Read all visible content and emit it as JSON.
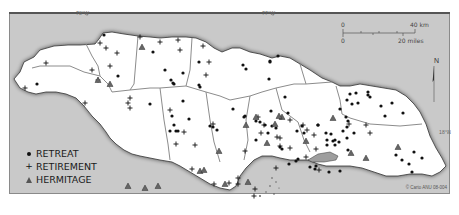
{
  "map": {
    "region": "Jamaica",
    "background_color": "#c9c9c9",
    "land_color": "#ffffff",
    "boundary_color": "#8c8c8c",
    "coordinates": {
      "lon_left": "78°W",
      "lon_right": "77°W",
      "lat_right": "18°N"
    },
    "scale_bar": {
      "km_start": "0",
      "km_end": "40 km",
      "miles_start": "0",
      "miles_end": "20 miles"
    },
    "north_arrow": "N",
    "credit": "© Carto ANU 08-004"
  },
  "legend": {
    "items": [
      {
        "symbol": "dot",
        "label": "RETREAT"
      },
      {
        "symbol": "plus",
        "label": "RETIREMENT"
      },
      {
        "symbol": "triangle",
        "label": "HERMITAGE"
      }
    ]
  },
  "points": {
    "retreat": [
      [
        104,
        35
      ],
      [
        153,
        52
      ],
      [
        165,
        70
      ],
      [
        118,
        76
      ],
      [
        183,
        73
      ],
      [
        174,
        84
      ],
      [
        199,
        62
      ],
      [
        199,
        85
      ],
      [
        37,
        84
      ],
      [
        200,
        87
      ],
      [
        183,
        101
      ],
      [
        243,
        65
      ],
      [
        270,
        61
      ],
      [
        270,
        62
      ],
      [
        246,
        69
      ],
      [
        278,
        56
      ],
      [
        269,
        79
      ],
      [
        285,
        97
      ],
      [
        271,
        111
      ],
      [
        288,
        113
      ],
      [
        281,
        118
      ],
      [
        302,
        126
      ],
      [
        318,
        125
      ],
      [
        297,
        131
      ],
      [
        318,
        125
      ],
      [
        327,
        140
      ],
      [
        335,
        140
      ],
      [
        327,
        145
      ],
      [
        335,
        145
      ],
      [
        296,
        161
      ],
      [
        310,
        167
      ],
      [
        316,
        166
      ],
      [
        315,
        169
      ],
      [
        329,
        172
      ],
      [
        340,
        171
      ],
      [
        304,
        133
      ],
      [
        350,
        94
      ],
      [
        356,
        93
      ],
      [
        347,
        100
      ],
      [
        358,
        103
      ],
      [
        340,
        109
      ],
      [
        346,
        117
      ],
      [
        348,
        121
      ],
      [
        347,
        127
      ],
      [
        368,
        92
      ],
      [
        368,
        95
      ],
      [
        370,
        97
      ],
      [
        352,
        104
      ],
      [
        381,
        106
      ],
      [
        392,
        103
      ],
      [
        385,
        116
      ],
      [
        403,
        113
      ],
      [
        343,
        131
      ],
      [
        331,
        134
      ],
      [
        333,
        141
      ],
      [
        326,
        133
      ],
      [
        339,
        142
      ],
      [
        354,
        133
      ],
      [
        347,
        138
      ],
      [
        348,
        150
      ],
      [
        402,
        160
      ],
      [
        409,
        164
      ],
      [
        414,
        152
      ],
      [
        412,
        172
      ],
      [
        422,
        158
      ],
      [
        396,
        155
      ],
      [
        171,
        80
      ],
      [
        173,
        83
      ],
      [
        150,
        104
      ],
      [
        172,
        116
      ],
      [
        176,
        131
      ],
      [
        178,
        131
      ],
      [
        170,
        131
      ],
      [
        174,
        125
      ],
      [
        189,
        119
      ],
      [
        210,
        126
      ],
      [
        217,
        130
      ],
      [
        213,
        127
      ],
      [
        245,
        116
      ],
      [
        256,
        121
      ],
      [
        272,
        126
      ],
      [
        256,
        140
      ],
      [
        268,
        133
      ],
      [
        282,
        149
      ],
      [
        289,
        164
      ],
      [
        298,
        159
      ],
      [
        233,
        109
      ],
      [
        244,
        117
      ],
      [
        260,
        122
      ],
      [
        265,
        125
      ],
      [
        276,
        128
      ],
      [
        280,
        147
      ]
    ],
    "retirement": [
      [
        100,
        43
      ],
      [
        106,
        48
      ],
      [
        117,
        53
      ],
      [
        140,
        37
      ],
      [
        160,
        42
      ],
      [
        178,
        40
      ],
      [
        180,
        50
      ],
      [
        203,
        46
      ],
      [
        209,
        62
      ],
      [
        206,
        75
      ],
      [
        110,
        66
      ],
      [
        92,
        70
      ],
      [
        46,
        63
      ],
      [
        25,
        88
      ],
      [
        98,
        80
      ],
      [
        85,
        103
      ],
      [
        130,
        98
      ],
      [
        128,
        103
      ],
      [
        130,
        108
      ],
      [
        170,
        110
      ],
      [
        213,
        124
      ],
      [
        258,
        117
      ],
      [
        277,
        137
      ],
      [
        280,
        146
      ],
      [
        290,
        148
      ],
      [
        264,
        125
      ],
      [
        261,
        133
      ],
      [
        280,
        138
      ],
      [
        307,
        130
      ],
      [
        316,
        149
      ],
      [
        306,
        157
      ],
      [
        319,
        170
      ],
      [
        276,
        168
      ],
      [
        314,
        135
      ],
      [
        303,
        125
      ],
      [
        366,
        125
      ],
      [
        370,
        133
      ],
      [
        349,
        124
      ],
      [
        254,
        196
      ],
      [
        255,
        189
      ],
      [
        238,
        178
      ],
      [
        238,
        184
      ],
      [
        229,
        183
      ],
      [
        214,
        184
      ],
      [
        192,
        169
      ],
      [
        290,
        120
      ],
      [
        195,
        145
      ],
      [
        245,
        151
      ],
      [
        176,
        144
      ],
      [
        184,
        132
      ]
    ],
    "hermitage": [
      [
        142,
        47
      ],
      [
        98,
        80
      ],
      [
        110,
        84
      ],
      [
        128,
        186
      ],
      [
        145,
        188
      ],
      [
        158,
        186
      ],
      [
        219,
        151
      ],
      [
        246,
        125
      ],
      [
        256,
        117
      ],
      [
        306,
        141
      ],
      [
        333,
        118
      ],
      [
        351,
        153
      ],
      [
        366,
        158
      ],
      [
        398,
        147
      ],
      [
        225,
        184
      ],
      [
        248,
        182
      ],
      [
        282,
        117
      ],
      [
        279,
        116
      ],
      [
        275,
        124
      ],
      [
        200,
        171
      ],
      [
        204,
        170
      ],
      [
        267,
        143
      ]
    ]
  }
}
